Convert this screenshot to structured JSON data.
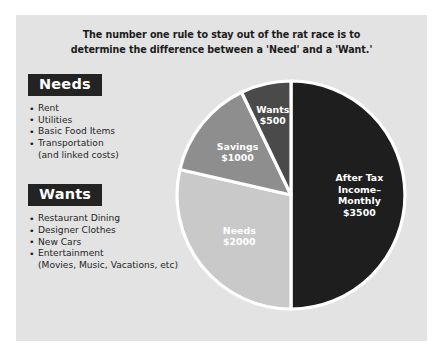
{
  "panel": {
    "background_color": "#e3e3e3",
    "page_background_color": "#ffffff"
  },
  "title": {
    "line1": "The number one rule to stay out of the rat race is to",
    "line2": "determine the difference between a 'Need' and a 'Want.'"
  },
  "categories": [
    {
      "badge_label": "Needs",
      "items": [
        {
          "text": "Rent",
          "sub": false
        },
        {
          "text": "Utilities",
          "sub": false
        },
        {
          "text": "Basic Food Items",
          "sub": false
        },
        {
          "text": "Transportation",
          "sub": false
        },
        {
          "text": "(and linked costs)",
          "sub": true
        }
      ]
    },
    {
      "badge_label": "Wants",
      "items": [
        {
          "text": "Restaurant Dining",
          "sub": false
        },
        {
          "text": "Designer Clothes",
          "sub": false
        },
        {
          "text": "New Cars",
          "sub": false
        },
        {
          "text": "Entertainment",
          "sub": false
        },
        {
          "text": "(Movies, Music, Vacations, etc)",
          "sub": true
        }
      ]
    }
  ],
  "chart_data": {
    "type": "pie",
    "title": "The number one rule to stay out of the rat race is to determine the difference between a 'Need' and a 'Want.'",
    "xlabel": "",
    "ylabel": "",
    "total": 7000,
    "units": "USD per month",
    "legend_position": "none",
    "grid": false,
    "start_angle_deg": 0,
    "direction": "clockwise",
    "categories": [
      "After Tax Income-Monthly",
      "Needs",
      "Savings",
      "Wants"
    ],
    "values": [
      3500,
      2000,
      1000,
      500
    ],
    "slices": [
      {
        "name": "After Tax Income-Monthly",
        "value": 3500,
        "amount_label": "$3500",
        "label_lines": [
          "After Tax",
          "Income–",
          "Monthly",
          "$3500"
        ],
        "color": "#1e1e1e",
        "percent": 50,
        "start_angle_deg": 0,
        "end_angle_deg": 180
      },
      {
        "name": "Needs",
        "value": 2000,
        "amount_label": "$2000",
        "label_lines": [
          "Needs",
          "$2000"
        ],
        "color": "#c9c9c9",
        "percent": 28.6,
        "start_angle_deg": 180,
        "end_angle_deg": 282.9
      },
      {
        "name": "Savings",
        "value": 1000,
        "amount_label": "$1000",
        "label_lines": [
          "Savings",
          "$1000"
        ],
        "color": "#8e8e8e",
        "percent": 14.3,
        "start_angle_deg": 282.9,
        "end_angle_deg": 334.3
      },
      {
        "name": "Wants",
        "value": 500,
        "amount_label": "$500",
        "label_lines": [
          "Wants",
          "$500"
        ],
        "color": "#4a4a4a",
        "percent": 7.1,
        "start_angle_deg": 334.3,
        "end_angle_deg": 360
      }
    ],
    "separator_color": "#ffffff"
  }
}
